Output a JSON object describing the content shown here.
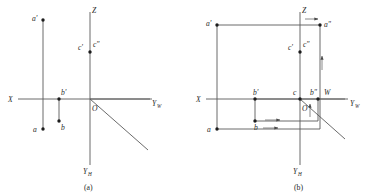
{
  "figure": {
    "panels": [
      {
        "id": "a",
        "caption": "(a)",
        "axes": {
          "x_label": "X",
          "z_label": "Z",
          "yw_label": "Y",
          "yw_sub": "W",
          "yh_label": "Y",
          "yh_sub": "H",
          "origin_label": "O"
        },
        "points": [
          {
            "name": "a-prime",
            "label": "a'"
          },
          {
            "name": "a",
            "label": "a"
          },
          {
            "name": "b-prime",
            "label": "b'"
          },
          {
            "name": "b",
            "label": "b"
          },
          {
            "name": "c-prime",
            "label": "c'"
          },
          {
            "name": "c-double-prime",
            "label": "c\""
          }
        ]
      },
      {
        "id": "b",
        "caption": "(b)",
        "axes": {
          "x_label": "X",
          "z_label": "Z",
          "yw_label": "Y",
          "yw_sub": "W",
          "yh_label": "Y",
          "yh_sub": "H",
          "origin_label": "O",
          "w_label": "W"
        },
        "points": [
          {
            "name": "a-prime",
            "label": "a'"
          },
          {
            "name": "a-double-prime",
            "label": "a\""
          },
          {
            "name": "a",
            "label": "a"
          },
          {
            "name": "b-prime",
            "label": "b'"
          },
          {
            "name": "b-double-prime",
            "label": "b\""
          },
          {
            "name": "b",
            "label": "b"
          },
          {
            "name": "c",
            "label": "c"
          },
          {
            "name": "c-prime",
            "label": "c'"
          },
          {
            "name": "c-double-prime",
            "label": "c\""
          }
        ]
      }
    ],
    "colors": {
      "line": "#5a5a5a",
      "point": "#1c1c1c",
      "text": "#2a2a2a",
      "background": "#ffffff"
    }
  }
}
